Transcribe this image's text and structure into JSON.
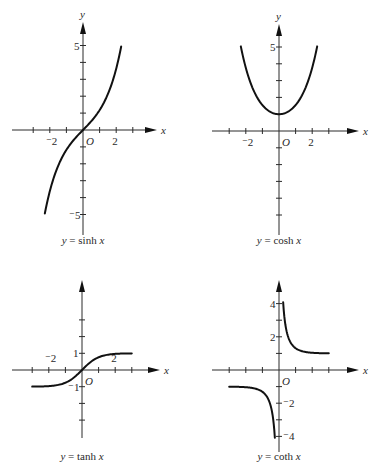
{
  "chart_data": [
    {
      "type": "line",
      "title": "y = sinh x",
      "caption_parts": {
        "lhs": "y",
        "eq": "=",
        "fn": "sinh",
        "arg": "x"
      },
      "xlabel": "x",
      "ylabel": "y",
      "origin_label": "O",
      "x_ticks": [
        -3,
        -2,
        -1,
        1,
        2,
        3
      ],
      "x_tick_labels": {
        "-2": "⁻2",
        "2": "2"
      },
      "y_ticks": [
        -5,
        -4,
        -3,
        -2,
        -1,
        1,
        2,
        3,
        4,
        5
      ],
      "y_tick_labels": {
        "5": "5",
        "-5": "⁻5"
      },
      "xlim": [
        -4,
        4
      ],
      "ylim": [
        -6,
        6
      ],
      "series": [
        {
          "name": "sinh x",
          "x": [
            -2.3,
            -2,
            -1.5,
            -1,
            -0.5,
            0,
            0.5,
            1,
            1.5,
            2,
            2.3
          ],
          "y": [
            -4.94,
            -3.63,
            -2.13,
            -1.18,
            -0.52,
            0,
            0.52,
            1.18,
            2.13,
            3.63,
            4.94
          ]
        }
      ]
    },
    {
      "type": "line",
      "title": "y = cosh x",
      "caption_parts": {
        "lhs": "y",
        "eq": "=",
        "fn": "cosh",
        "arg": "x"
      },
      "xlabel": "x",
      "ylabel": "y",
      "origin_label": "O",
      "x_ticks": [
        -3,
        -2,
        -1,
        1,
        2,
        3
      ],
      "x_tick_labels": {
        "-2": "⁻2",
        "2": "2"
      },
      "y_ticks": [
        -5,
        -4,
        -3,
        -2,
        -1,
        1,
        2,
        3,
        4,
        5
      ],
      "y_tick_labels": {
        "5": "5"
      },
      "xlim": [
        -4,
        4
      ],
      "ylim": [
        -6,
        6
      ],
      "series": [
        {
          "name": "cosh x",
          "x": [
            -2.3,
            -2,
            -1.5,
            -1,
            -0.5,
            0,
            0.5,
            1,
            1.5,
            2,
            2.3
          ],
          "y": [
            5.04,
            3.76,
            2.35,
            1.54,
            1.13,
            1,
            1.13,
            1.54,
            2.35,
            3.76,
            5.04
          ]
        }
      ]
    },
    {
      "type": "line",
      "title": "y = tanh x",
      "caption_parts": {
        "lhs": "y",
        "eq": "=",
        "fn": "tanh",
        "arg": "x"
      },
      "xlabel": "x",
      "ylabel": "",
      "origin_label": "O",
      "x_ticks": [
        -3,
        -2,
        -1,
        1,
        2,
        3
      ],
      "x_tick_labels": {
        "-2": "⁻2",
        "2": "2"
      },
      "y_ticks": [
        -3,
        -2,
        -1,
        1,
        2,
        3
      ],
      "y_tick_labels": {
        "1": "1",
        "-1": "⁻1"
      },
      "xlim": [
        -4,
        4
      ],
      "ylim": [
        -4,
        5
      ],
      "series": [
        {
          "name": "tanh x",
          "x": [
            -3,
            -2,
            -1.5,
            -1,
            -0.5,
            0,
            0.5,
            1,
            1.5,
            2,
            3
          ],
          "y": [
            -0.995,
            -0.964,
            -0.905,
            -0.762,
            -0.462,
            0,
            0.462,
            0.762,
            0.905,
            0.964,
            0.995
          ]
        }
      ]
    },
    {
      "type": "line",
      "title": "y = coth x",
      "caption_parts": {
        "lhs": "y",
        "eq": "=",
        "fn": "coth",
        "arg": "x"
      },
      "xlabel": "x",
      "ylabel": "",
      "origin_label": "O",
      "x_ticks": [
        -3,
        -2,
        -1,
        1,
        2,
        3
      ],
      "x_tick_labels": {},
      "y_ticks": [
        -4,
        -3,
        -2,
        -1,
        1,
        2,
        3,
        4
      ],
      "y_tick_labels": {
        "4": "4",
        "2": "2",
        "-2": "⁻2",
        "-4": "⁻4"
      },
      "xlim": [
        -4,
        4
      ],
      "ylim": [
        -5,
        5
      ],
      "series": [
        {
          "name": "coth x (x>0)",
          "x": [
            0.25,
            0.3,
            0.5,
            0.75,
            1,
            1.5,
            2,
            2.5,
            3
          ],
          "y": [
            4.08,
            3.43,
            2.16,
            1.57,
            1.31,
            1.1,
            1.04,
            1.01,
            1.005
          ]
        },
        {
          "name": "coth x (x<0)",
          "x": [
            -3,
            -2.5,
            -2,
            -1.5,
            -1,
            -0.75,
            -0.5,
            -0.3,
            -0.25
          ],
          "y": [
            -1.005,
            -1.01,
            -1.04,
            -1.1,
            -1.31,
            -1.57,
            -2.16,
            -3.43,
            -4.08
          ]
        }
      ]
    }
  ],
  "layout": {
    "panels": [
      {
        "ox": 83,
        "oy": 130,
        "ux": 16.6,
        "uy": 16.9,
        "xaxis": [
          12,
          157
        ],
        "yaxis": [
          22,
          235
        ],
        "label_y": 243,
        "caption_x": 83,
        "caption_y": 244
      },
      {
        "ox": 279,
        "oy": 131,
        "ux": 16.6,
        "uy": 16.8,
        "xaxis": [
          212,
          359
        ],
        "yaxis": [
          24,
          235
        ],
        "label_y": 243,
        "caption_x": 279,
        "caption_y": 244
      },
      {
        "ox": 82,
        "oy": 370,
        "ux": 16.6,
        "uy": 16.7,
        "xaxis": [
          12,
          160
        ],
        "yaxis": [
          280,
          438
        ],
        "caption_x": 82,
        "caption_y": 460
      },
      {
        "ox": 279,
        "oy": 370,
        "ux": 16.6,
        "uy": 16.6,
        "xaxis": [
          212,
          359
        ],
        "yaxis": [
          280,
          452
        ],
        "caption_x": 279,
        "caption_y": 460
      }
    ]
  }
}
